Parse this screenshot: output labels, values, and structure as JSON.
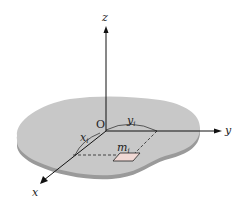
{
  "diagram": {
    "type": "3D coordinate system with planar lamina",
    "axes": {
      "x_label": "x",
      "y_label": "y",
      "z_label": "z",
      "origin_label": "O"
    },
    "coordinates": {
      "x_i_label": "x",
      "x_i_sub": "i",
      "y_i_label": "y",
      "y_i_sub": "i"
    },
    "mass_element": {
      "label": "m",
      "sub": "i",
      "color": "#f0d8d4"
    },
    "colors": {
      "lamina_top": "#c8c8c8",
      "lamina_edge": "#9a9a9a",
      "axis": "#111111"
    }
  }
}
